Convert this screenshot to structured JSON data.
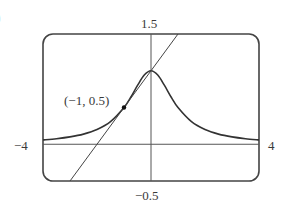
{
  "part_label": ")",
  "chart_data": {
    "type": "line",
    "title": "",
    "xlabel": "",
    "ylabel": "",
    "xlim": [
      -4,
      4
    ],
    "ylim": [
      -0.5,
      1.5
    ],
    "grid": false,
    "legend": null,
    "tick_labels": {
      "x_min": "−4",
      "x_max": "4",
      "y_min": "−0.5",
      "y_max": "1.5"
    },
    "series": [
      {
        "name": "curve y = 1/(1+x^2)",
        "x": [
          -4,
          -3.5,
          -3,
          -2.5,
          -2,
          -1.5,
          -1,
          -0.75,
          -0.5,
          -0.25,
          0,
          0.25,
          0.5,
          0.75,
          1,
          1.5,
          2,
          2.5,
          3,
          3.5,
          4
        ],
        "y": [
          0.0588,
          0.0755,
          0.1,
          0.1379,
          0.2,
          0.3077,
          0.5,
          0.64,
          0.8,
          0.9412,
          1.0,
          0.9412,
          0.8,
          0.64,
          0.5,
          0.3077,
          0.2,
          0.1379,
          0.1,
          0.0755,
          0.0588
        ]
      },
      {
        "name": "tangent line y = 0.5x + 1",
        "x": [
          -3,
          1
        ],
        "y": [
          -0.5,
          1.5
        ]
      }
    ],
    "annotations": [
      {
        "text": "(−1, 0.5)",
        "x": -1,
        "y": 0.5,
        "marker": "point"
      }
    ]
  }
}
